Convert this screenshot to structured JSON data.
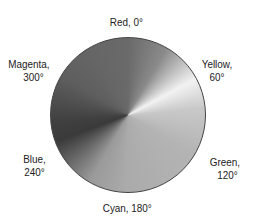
{
  "labels": {
    "red": "Red, 0°",
    "yellow_name": "Yellow,",
    "yellow_deg": "60°",
    "green_name": "Green,",
    "green_deg": "120°",
    "cyan": "Cyan, 180°",
    "blue_name": "Blue,",
    "blue_deg": "240°",
    "magenta_name": "Magenta,",
    "magenta_deg": "300°"
  }
}
